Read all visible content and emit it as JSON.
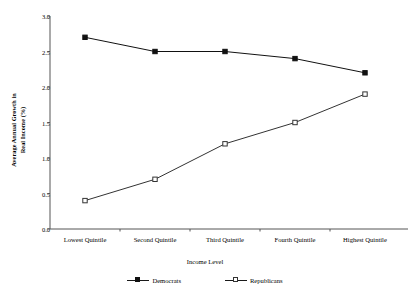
{
  "chart_data": {
    "type": "line",
    "title": "",
    "xlabel": "Income Level",
    "ylabel": "Average Annual Growth in Real Income (%)",
    "ylabel_line1": "Average Annual Growth in",
    "ylabel_line2": "Real Income (%)",
    "categories": [
      "Lowest Quintile",
      "Second Quintile",
      "Third Quintile",
      "Fourth Quintile",
      "Highest Quintile"
    ],
    "yticks": [
      "0.0",
      "0.5",
      "1.0",
      "1.5",
      "2.0",
      "2.5",
      "3.0"
    ],
    "ytick_values": [
      0.0,
      0.5,
      1.0,
      1.5,
      2.0,
      2.5,
      3.0
    ],
    "ylim": [
      0.0,
      3.0
    ],
    "grid": false,
    "legend_position": "bottom",
    "series": [
      {
        "name": "Democrats",
        "marker": "filled-square",
        "color": "#111111",
        "values": [
          2.7,
          2.5,
          2.5,
          2.4,
          2.2
        ]
      },
      {
        "name": "Republicans",
        "marker": "open-square",
        "color": "#333333",
        "values": [
          0.4,
          0.7,
          1.2,
          1.5,
          1.9
        ]
      }
    ]
  }
}
